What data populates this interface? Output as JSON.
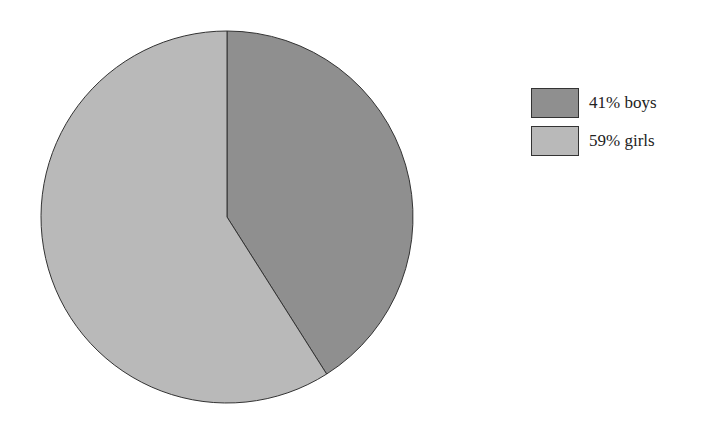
{
  "chart_data": {
    "type": "pie",
    "title": "",
    "categories": [
      "boys",
      "girls"
    ],
    "values": [
      41,
      59
    ],
    "unit": "%",
    "colors": [
      "#8f8f8f",
      "#b9b9b9"
    ],
    "start_angle": "12 o'clock",
    "direction": "clockwise",
    "legend_position": "right",
    "legend": [
      {
        "label": "41% boys",
        "color": "#8f8f8f"
      },
      {
        "label": "59% girls",
        "color": "#b9b9b9"
      }
    ]
  }
}
